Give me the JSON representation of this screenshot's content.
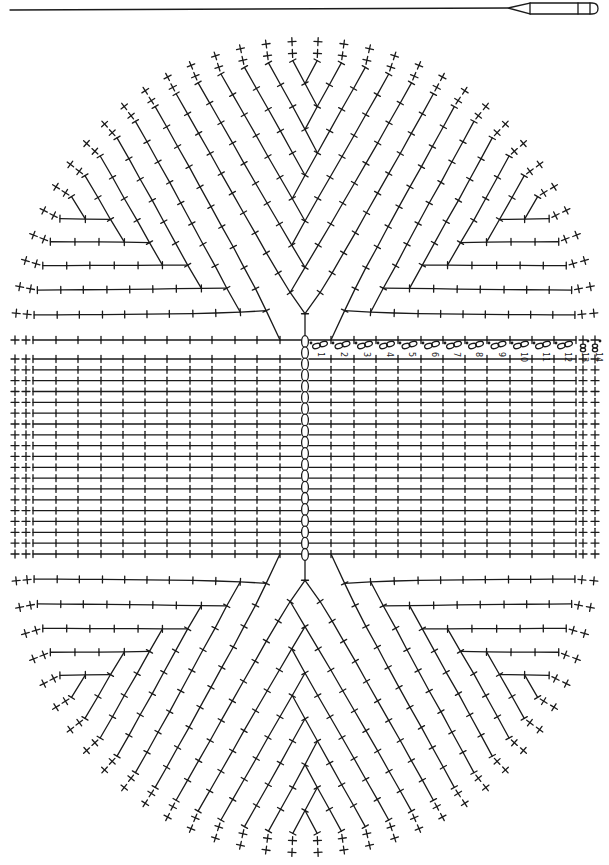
{
  "diagram": {
    "type": "crochet-oval-chart",
    "hook_icon": "crochet-hook-icon",
    "colors": {
      "ink": "#1a1a1a",
      "background": "#ffffff"
    },
    "center_x": 305,
    "top_fan_center_y": 340,
    "bottom_fan_center_y": 554,
    "foundation_chain": {
      "symbol": "chain-oval",
      "count": 20,
      "top_y": 336,
      "bottom_y": 560
    },
    "straight_rows": {
      "count": 18,
      "first_y": 359,
      "spacing": 10.83
    },
    "rounds": [
      {
        "n": 1,
        "stitch": "hdc",
        "left_x": 280,
        "right_x": 331,
        "label": "1",
        "label_x": 318
      },
      {
        "n": 2,
        "stitch": "hdc",
        "left_x": 257,
        "right_x": 354,
        "label": "2",
        "label_x": 341
      },
      {
        "n": 3,
        "stitch": "hdc",
        "left_x": 235,
        "right_x": 376,
        "label": "3",
        "label_x": 364
      },
      {
        "n": 4,
        "stitch": "hdc",
        "left_x": 212,
        "right_x": 398,
        "label": "4",
        "label_x": 387
      },
      {
        "n": 5,
        "stitch": "hdc",
        "left_x": 190,
        "right_x": 421,
        "label": "5",
        "label_x": 409
      },
      {
        "n": 6,
        "stitch": "hdc",
        "left_x": 167,
        "right_x": 443,
        "label": "6",
        "label_x": 432
      },
      {
        "n": 7,
        "stitch": "hdc",
        "left_x": 145,
        "right_x": 465,
        "label": "7",
        "label_x": 454
      },
      {
        "n": 8,
        "stitch": "hdc",
        "left_x": 123,
        "right_x": 487,
        "label": "8",
        "label_x": 476
      },
      {
        "n": 9,
        "stitch": "hdc",
        "left_x": 101,
        "right_x": 510,
        "label": "9",
        "label_x": 499
      },
      {
        "n": 10,
        "stitch": "hdc",
        "left_x": 78,
        "right_x": 532,
        "label": "10",
        "label_x": 521
      },
      {
        "n": 11,
        "stitch": "hdc",
        "left_x": 56,
        "right_x": 554,
        "label": "11",
        "label_x": 543
      },
      {
        "n": 12,
        "stitch": "hdc",
        "left_x": 33,
        "right_x": 576,
        "label": "12",
        "label_x": 565
      },
      {
        "n": 13,
        "stitch": "sc",
        "left_x": 26,
        "right_x": 583,
        "label": "13",
        "label_x": 582
      },
      {
        "n": 14,
        "stitch": "sc",
        "left_x": 15,
        "right_x": 595,
        "label": "14",
        "label_x": 596
      }
    ],
    "legend_symbols": {
      "hdc": "T-bar stitch (half double crochet)",
      "sc": "+ (single crochet)",
      "ch": "oval (chain)",
      "sl_st": "dot (slip stitch)"
    }
  }
}
